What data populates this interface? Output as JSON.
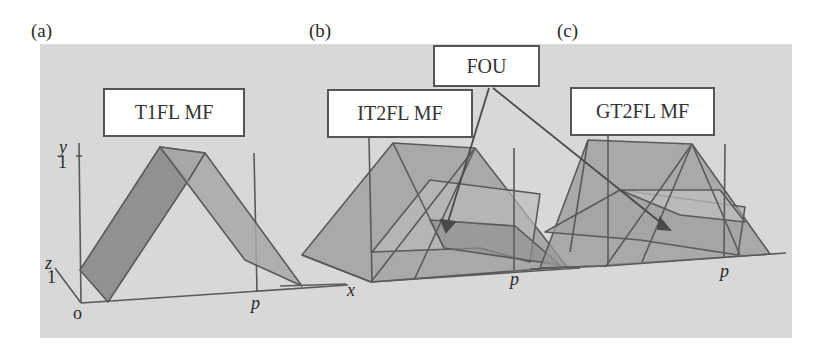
{
  "figure": {
    "panels": [
      {
        "letter": "(a)",
        "label": "T1FL MF"
      },
      {
        "letter": "(b)",
        "label": "IT2FL MF"
      },
      {
        "letter": "(c)",
        "label": "GT2FL MF"
      }
    ],
    "callout": {
      "label": "FOU"
    },
    "axes": {
      "y_label": "y",
      "y_tick": "1",
      "z_label": "z",
      "z_tick": "1",
      "origin_label": "o",
      "x_label": "x",
      "p_label": "p"
    },
    "colors": {
      "background": "#d8d8d8",
      "shape_dark": "#8a8a8a",
      "shape_light": "#a8a8a8",
      "line": "#5a5a5a",
      "label_border": "#555555"
    }
  }
}
